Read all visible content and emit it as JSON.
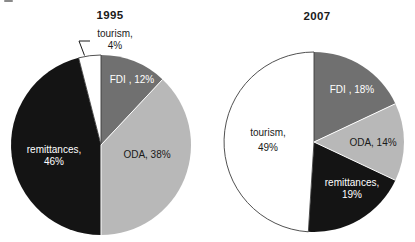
{
  "page": {
    "background": "#ffffff",
    "text_color": "#1a1a1a"
  },
  "chart_data": [
    {
      "type": "pie",
      "title": "1995",
      "start_angle_deg": 0,
      "direction": "clockwise",
      "legend_position": "none",
      "slices": [
        {
          "label": "FDI",
          "value": 12,
          "color": "#707070",
          "text_color": "#ffffff",
          "line1": "FDI , 12%",
          "line2": ""
        },
        {
          "label": "ODA",
          "value": 38,
          "color": "#b8b8b8",
          "text_color": "#1a1a1a",
          "line1": "ODA, 38%",
          "line2": ""
        },
        {
          "label": "remittances",
          "value": 46,
          "color": "#141414",
          "text_color": "#ffffff",
          "line1": "remittances,",
          "line2": "46%"
        },
        {
          "label": "tourism",
          "value": 4,
          "color": "#ffffff",
          "text_color": "#1a1a1a",
          "line1": "tourism,",
          "line2": "4%"
        }
      ]
    },
    {
      "type": "pie",
      "title": "2007",
      "start_angle_deg": 0,
      "direction": "clockwise",
      "legend_position": "none",
      "slices": [
        {
          "label": "FDI",
          "value": 18,
          "color": "#707070",
          "text_color": "#ffffff",
          "line1": "FDI , 18%",
          "line2": ""
        },
        {
          "label": "ODA",
          "value": 14,
          "color": "#b8b8b8",
          "text_color": "#1a1a1a",
          "line1": "ODA, 14%",
          "line2": ""
        },
        {
          "label": "remittances",
          "value": 19,
          "color": "#141414",
          "text_color": "#ffffff",
          "line1": "remittances,",
          "line2": "19%"
        },
        {
          "label": "tourism",
          "value": 49,
          "color": "#ffffff",
          "text_color": "#1a1a1a",
          "line1": "tourism,",
          "line2": "49%"
        }
      ]
    }
  ],
  "style": {
    "separator_color": "#ffffff",
    "white_slice_outline": "#3d3d3d",
    "leader_line_color": "#1a1a1a"
  }
}
